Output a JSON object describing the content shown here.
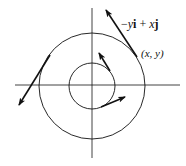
{
  "figure": {
    "type": "vector-field-diagram",
    "labels": {
      "vector_expr": {
        "minus": "−",
        "y": "y",
        "i": "i",
        "plus": " + ",
        "x": "x",
        "j": "j"
      },
      "point": "(x, y)"
    },
    "colors": {
      "ink": "#111111",
      "background": "#ffffff"
    },
    "geometry": {
      "center": [
        92,
        86
      ],
      "outer_radius": 54,
      "inner_radius": 23,
      "x_axis": [
        15,
        180
      ],
      "y_axis": [
        8,
        158
      ]
    },
    "arrows": [
      {
        "name": "outer-top-right",
        "from": [
          137,
          57
        ],
        "to": [
          106,
          10
        ]
      },
      {
        "name": "outer-left",
        "from": [
          50,
          55
        ],
        "to": [
          19,
          105
        ]
      },
      {
        "name": "inner-top",
        "from": [
          110,
          71
        ],
        "to": [
          99,
          53
        ]
      },
      {
        "name": "inner-bottom-right",
        "from": [
          101,
          107
        ],
        "to": [
          125,
          97
        ]
      }
    ]
  }
}
